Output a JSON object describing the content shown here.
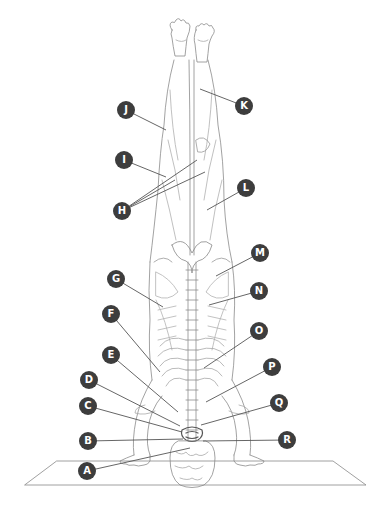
{
  "diagram": {
    "colors": {
      "callout_fill": "#3d3d3d",
      "callout_text": "#ffffff",
      "line": "#555555",
      "outline": "#8a8a8a"
    },
    "callouts": [
      {
        "label": "A",
        "x": 87,
        "y": 471,
        "targets": [
          [
            190,
            448
          ]
        ]
      },
      {
        "label": "B",
        "x": 88,
        "y": 441,
        "targets": [
          [
            183,
            439
          ]
        ]
      },
      {
        "label": "C",
        "x": 88,
        "y": 406,
        "targets": [
          [
            182,
            432
          ]
        ]
      },
      {
        "label": "D",
        "x": 89,
        "y": 380,
        "targets": [
          [
            180,
            426
          ]
        ]
      },
      {
        "label": "E",
        "x": 111,
        "y": 355,
        "targets": [
          [
            178,
            412
          ]
        ]
      },
      {
        "label": "F",
        "x": 111,
        "y": 314,
        "targets": [
          [
            160,
            372
          ]
        ]
      },
      {
        "label": "G",
        "x": 116,
        "y": 279,
        "targets": [
          [
            163,
            307
          ]
        ]
      },
      {
        "label": "H",
        "x": 122,
        "y": 211,
        "targets": [
          [
            197,
            160
          ],
          [
            205,
            172
          ],
          [
            175,
            180
          ]
        ]
      },
      {
        "label": "I",
        "x": 124,
        "y": 160,
        "targets": [
          [
            166,
            177
          ]
        ]
      },
      {
        "label": "J",
        "x": 126,
        "y": 110,
        "targets": [
          [
            166,
            130
          ]
        ]
      },
      {
        "label": "K",
        "x": 244,
        "y": 106,
        "targets": [
          [
            200,
            89
          ]
        ]
      },
      {
        "label": "L",
        "x": 246,
        "y": 188,
        "targets": [
          [
            207,
            210
          ]
        ]
      },
      {
        "label": "M",
        "x": 260,
        "y": 253,
        "targets": [
          [
            216,
            276
          ]
        ]
      },
      {
        "label": "N",
        "x": 259,
        "y": 291,
        "targets": [
          [
            209,
            305
          ]
        ]
      },
      {
        "label": "O",
        "x": 259,
        "y": 331,
        "targets": [
          [
            204,
            368
          ]
        ]
      },
      {
        "label": "P",
        "x": 272,
        "y": 367,
        "targets": [
          [
            206,
            402
          ]
        ]
      },
      {
        "label": "Q",
        "x": 279,
        "y": 403,
        "targets": [
          [
            201,
            425
          ]
        ]
      },
      {
        "label": "R",
        "x": 287,
        "y": 440,
        "targets": [
          [
            203,
            441
          ]
        ]
      }
    ]
  }
}
